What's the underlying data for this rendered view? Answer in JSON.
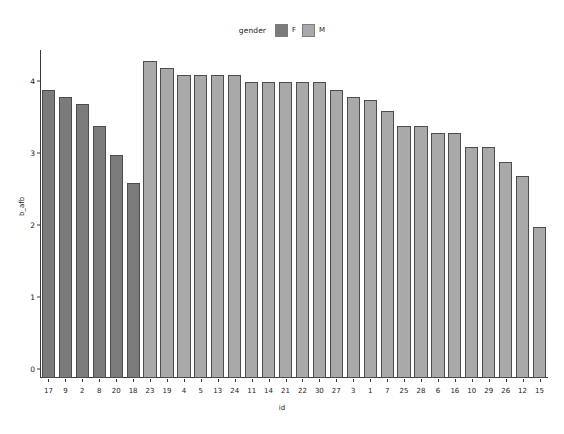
{
  "chart_data": {
    "type": "bar",
    "title": "",
    "xlabel": "id",
    "ylabel": "b_afb",
    "ylim": [
      0,
      4.55
    ],
    "yticks": [
      0,
      1,
      2,
      3,
      4
    ],
    "grid": false,
    "legend": {
      "title": "gender",
      "position": "top",
      "entries": [
        {
          "label": "F",
          "color": "#7b7b7b"
        },
        {
          "label": "M",
          "color": "#a9a9a9"
        }
      ]
    },
    "categories": [
      "17",
      "9",
      "2",
      "8",
      "20",
      "18",
      "23",
      "19",
      "4",
      "5",
      "13",
      "24",
      "11",
      "14",
      "21",
      "22",
      "30",
      "27",
      "3",
      "1",
      "7",
      "25",
      "28",
      "6",
      "16",
      "10",
      "29",
      "26",
      "12",
      "15"
    ],
    "values": [
      4.0,
      3.9,
      3.8,
      3.5,
      3.1,
      2.7,
      4.4,
      4.3,
      4.2,
      4.2,
      4.2,
      4.2,
      4.1,
      4.1,
      4.1,
      4.1,
      4.1,
      4.0,
      3.9,
      3.85,
      3.7,
      3.5,
      3.5,
      3.4,
      3.4,
      3.2,
      3.2,
      3.0,
      2.8,
      2.1
    ],
    "groups": [
      "F",
      "F",
      "F",
      "F",
      "F",
      "F",
      "M",
      "M",
      "M",
      "M",
      "M",
      "M",
      "M",
      "M",
      "M",
      "M",
      "M",
      "M",
      "M",
      "M",
      "M",
      "M",
      "M",
      "M",
      "M",
      "M",
      "M",
      "M",
      "M",
      "M"
    ],
    "colors": {
      "F": "#7b7b7b",
      "M": "#a9a9a9"
    }
  }
}
